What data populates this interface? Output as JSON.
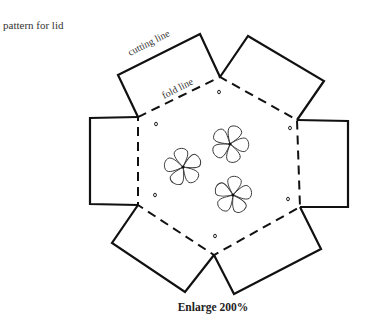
{
  "title": "pattern for lid",
  "labels": {
    "cutting_line": "cutting line",
    "fold_line": "fold line"
  },
  "caption": "Enlarge 200%",
  "diagram": {
    "shape": "hexagon with six rectangular tabs",
    "hexagon_vertices": [
      [
        138,
        117
      ],
      [
        220,
        77
      ],
      [
        297,
        120
      ],
      [
        300,
        207
      ],
      [
        214,
        255
      ],
      [
        138,
        205
      ]
    ],
    "flower_count": 3,
    "flower_centers": [
      [
        183,
        167
      ],
      [
        230,
        144
      ],
      [
        233,
        195
      ]
    ],
    "petals_per_flower": 5,
    "hole_marks": [
      [
        156,
        124
      ],
      [
        219,
        92
      ],
      [
        290,
        128
      ],
      [
        155,
        195
      ],
      [
        288,
        199
      ],
      [
        215,
        236
      ]
    ]
  }
}
